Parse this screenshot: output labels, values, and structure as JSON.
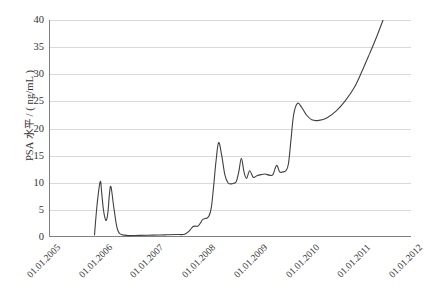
{
  "chart_data": {
    "type": "line",
    "title": "",
    "xlabel": "",
    "ylabel": "PSA 水平 / ( ng/mL )",
    "xlim": [
      2005.0,
      2012.0
    ],
    "ylim": [
      0,
      40
    ],
    "grid": true,
    "grid_axis": "y",
    "legend": "none",
    "line_color": "#404040",
    "grid_color": "#d9d9d9",
    "axis_color": "#808080",
    "x_tick_labels": [
      "01.01.2005",
      "01.01.2006",
      "01.01.2007",
      "01.01.2008",
      "01.01.2009",
      "01.01.2010",
      "01.01.2011",
      "01.01.2012"
    ],
    "x_tick_values": [
      2005,
      2006,
      2007,
      2008,
      2009,
      2010,
      2011,
      2012
    ],
    "y_tick_labels": [
      "0",
      "5",
      "10",
      "15",
      "20",
      "25",
      "30",
      "35",
      "40"
    ],
    "y_tick_values": [
      0,
      5,
      10,
      15,
      20,
      25,
      30,
      35,
      40
    ],
    "series": [
      {
        "name": "PSA",
        "x": [
          2005.88,
          2005.93,
          2005.99,
          2006.02,
          2006.05,
          2006.08,
          2006.11,
          2006.14,
          2006.17,
          2006.2,
          2006.26,
          2006.34,
          2006.5,
          2006.75,
          2007.0,
          2007.25,
          2007.5,
          2007.62,
          2007.72,
          2007.78,
          2007.83,
          2007.88,
          2007.93,
          2007.97,
          2008.02,
          2008.06,
          2008.1,
          2008.14,
          2008.18,
          2008.23,
          2008.28,
          2008.34,
          2008.4,
          2008.46,
          2008.52,
          2008.57,
          2008.62,
          2008.67,
          2008.72,
          2008.77,
          2008.82,
          2008.88,
          2008.95,
          2009.02,
          2009.1,
          2009.18,
          2009.26,
          2009.33,
          2009.4,
          2009.46,
          2009.52,
          2009.58,
          2009.63,
          2009.68,
          2009.73,
          2009.8,
          2009.88,
          2009.97,
          2010.08,
          2010.22,
          2010.38,
          2010.55,
          2010.72,
          2010.9,
          2011.05,
          2011.2,
          2011.34,
          2011.46
        ],
        "y": [
          0.4,
          6.0,
          10.2,
          8.0,
          5.2,
          3.6,
          3.1,
          4.6,
          8.0,
          9.2,
          5.0,
          1.0,
          0.3,
          0.3,
          0.35,
          0.4,
          0.45,
          0.5,
          1.2,
          1.9,
          2.0,
          2.0,
          2.6,
          3.2,
          3.4,
          3.5,
          4.0,
          5.5,
          9.0,
          14.0,
          17.4,
          15.0,
          11.5,
          10.0,
          9.8,
          9.9,
          10.2,
          12.0,
          14.5,
          12.0,
          10.8,
          12.2,
          11.0,
          11.3,
          11.5,
          11.6,
          11.4,
          11.5,
          13.2,
          12.0,
          12.0,
          12.2,
          13.5,
          18.0,
          22.5,
          24.6,
          24.0,
          22.6,
          21.6,
          21.5,
          22.0,
          23.2,
          25.0,
          27.5,
          30.5,
          33.8,
          37.0,
          40.0
        ]
      }
    ]
  }
}
